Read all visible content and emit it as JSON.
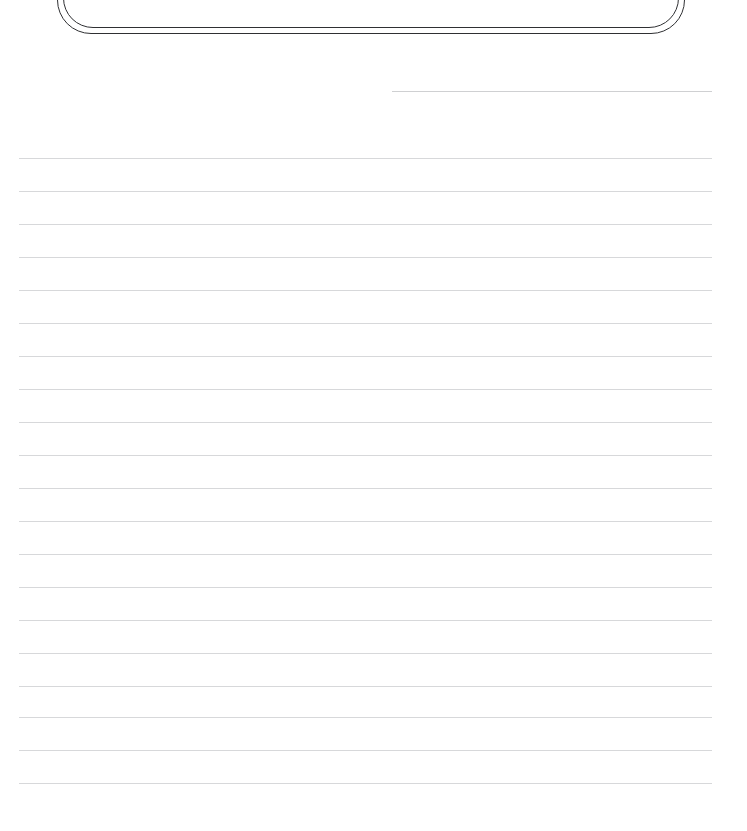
{
  "page": {
    "background_color": "#ffffff",
    "width": 747,
    "height": 831,
    "kind": "lined-paper-worksheet"
  },
  "title_frame": {
    "label": "Happy Writing",
    "border_color": "#2f3033",
    "border_style": "double-rounded",
    "clipped_by_top_edge": true
  },
  "header_rule": {
    "label": "",
    "color": "#cfd0d2",
    "x_start": 392,
    "x_end": 712,
    "y": 91
  },
  "ruled_lines": {
    "color": "#d7d8da",
    "x_start": 19,
    "x_end": 712,
    "spacing": 33,
    "first_y": 158,
    "count": 20,
    "y_positions": [
      158,
      191,
      224,
      257,
      290,
      323,
      356,
      389,
      422,
      455,
      488,
      521,
      554,
      587,
      620,
      653,
      686,
      717,
      750,
      783
    ],
    "text": [
      "",
      "",
      "",
      "",
      "",
      "",
      "",
      "",
      "",
      "",
      "",
      "",
      "",
      "",
      "",
      "",
      "",
      "",
      "",
      ""
    ]
  }
}
